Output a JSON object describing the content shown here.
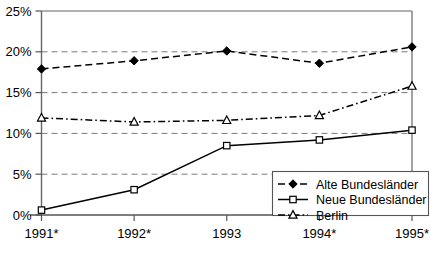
{
  "chart_data": {
    "type": "line",
    "title": "",
    "subtitle": "",
    "xlabel": "",
    "ylabel": "",
    "categories": [
      "1991*",
      "1992*",
      "1993",
      "1994*",
      "1995*"
    ],
    "x": [
      0,
      1,
      2,
      3,
      4
    ],
    "ylim": [
      0,
      25
    ],
    "ytick_values": [
      0,
      5,
      10,
      15,
      20,
      25
    ],
    "ytick_labels": [
      "0%",
      "5%",
      "10%",
      "15%",
      "20%",
      "25%"
    ],
    "grid": "horizontal-dashed",
    "legend_position": "bottom-right-inside",
    "series": [
      {
        "name": "Alte Bundesländer",
        "values": [
          17.9,
          18.9,
          20.1,
          18.6,
          20.6
        ],
        "marker": "filled-diamond",
        "line_style": "dashed",
        "color": "#000000"
      },
      {
        "name": "Neue Bundesländer",
        "values": [
          0.6,
          3.1,
          8.5,
          9.2,
          10.4
        ],
        "marker": "open-square",
        "line_style": "solid",
        "color": "#000000"
      },
      {
        "name": "Berlin",
        "values": [
          11.9,
          11.4,
          11.6,
          12.2,
          15.8
        ],
        "marker": "open-triangle",
        "line_style": "dash-dot",
        "color": "#000000"
      }
    ],
    "annotations": []
  },
  "legend": {
    "entries": [
      {
        "label": "Alte Bundesländer"
      },
      {
        "label": "Neue Bundesländer"
      },
      {
        "label": "Berlin"
      }
    ]
  },
  "colors": {
    "axis": "#555555",
    "grid": "#7a7a7a",
    "series": "#000000",
    "background": "#ffffff"
  }
}
